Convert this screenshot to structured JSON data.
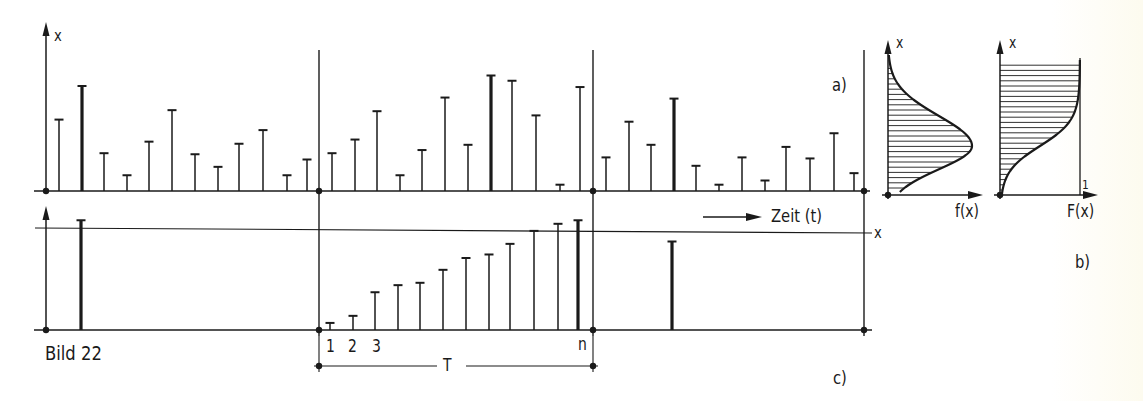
{
  "figure": {
    "caption": "Bild 22",
    "panel_a_label": "a)",
    "panel_b_label": "b)",
    "panel_c_label": "c)",
    "time_axis_label": "Zeit (t)",
    "y_axis_label": "x",
    "threshold_label": "x",
    "period_label": "T",
    "sample_labels": [
      "1",
      "2",
      "3",
      "n"
    ],
    "pdf_axis_label": "f(x)",
    "cdf_axis_label": "F(x)",
    "pdf_y_label": "x",
    "cdf_y_label": "x",
    "cdf_max_label": "1"
  },
  "chart_data": [
    {
      "type": "bar",
      "title": "a) Zufallswerte x über der Zeit (3 Perioden T)",
      "xlabel": "Zeit (t)",
      "ylabel": "x",
      "segments": [
        {
          "values": [
            0.68,
            1.0,
            0.36,
            0.15,
            0.47,
            0.77,
            0.35,
            0.23,
            0.45,
            0.58,
            0.15,
            0.3
          ],
          "max_index": 1
        },
        {
          "values": [
            0.36,
            0.49,
            0.76,
            0.15,
            0.39,
            0.89,
            0.44,
            1.1,
            1.05,
            0.72,
            0.06,
            0.99
          ],
          "max_index": 7
        },
        {
          "values": [
            0.32,
            0.66,
            0.44,
            0.88,
            0.24,
            0.06,
            0.32,
            0.1,
            0.42,
            0.31,
            0.55,
            0.17
          ],
          "max_index": 3
        }
      ]
    },
    {
      "type": "bar",
      "title": "c) Maximalwerte je Periode T; mittlere Periode sortiert 1..n",
      "ylabel": "x",
      "threshold": 0.86,
      "segments": [
        {
          "max_value": 0.93
        },
        {
          "sorted_values": [
            0.06,
            0.12,
            0.32,
            0.38,
            0.4,
            0.51,
            0.61,
            0.64,
            0.73,
            0.84,
            0.9,
            0.93
          ],
          "max_index": 11
        },
        {
          "max_value": 0.75
        }
      ]
    },
    {
      "type": "area",
      "title": "b) Dichtefunktion f(x) und Verteilungsfunktion F(x)",
      "series": [
        {
          "name": "f(x)",
          "shape": "bell",
          "peak_x_fraction": 0.32
        },
        {
          "name": "F(x)",
          "shape": "sigmoid",
          "max": 1
        }
      ]
    }
  ]
}
